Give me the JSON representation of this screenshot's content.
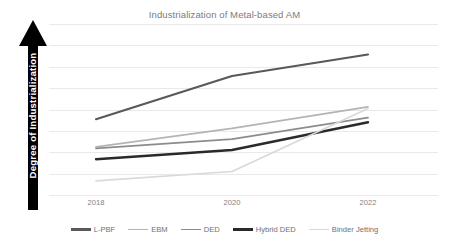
{
  "chart_data": {
    "type": "line",
    "title": "Industrialization of Metal-based AM",
    "xlabel": "",
    "ylabel": "Degree of Industrialization",
    "x": [
      2018,
      2020,
      2022
    ],
    "categories": [
      "2018",
      "2020",
      "2022"
    ],
    "grid": "horizontal",
    "legend_position": "bottom",
    "ylim": [
      0,
      100
    ],
    "y_axis_style": "arrow",
    "y_axis_ticks_visible": false,
    "series": [
      {
        "name": "L-PBF",
        "values": [
          46,
          74,
          88
        ],
        "color": "#595959"
      },
      {
        "name": "EBM",
        "values": [
          28,
          40,
          54
        ],
        "color": "#b4b4b4"
      },
      {
        "name": "DED",
        "values": [
          27,
          33,
          47
        ],
        "color": "#8c8c8c"
      },
      {
        "name": "Hybrid DED",
        "values": [
          20,
          26,
          44
        ],
        "color": "#2a2a2a"
      },
      {
        "name": "Binder Jetting",
        "values": [
          6,
          12,
          53
        ],
        "color": "#d9d9d9"
      }
    ]
  },
  "chart": {
    "title": "Industrialization of Metal-based AM",
    "y_axis_label": "Degree of Industrialization",
    "x_tick_labels": [
      "2018",
      "2020",
      "2022"
    ],
    "legend": [
      {
        "label": "L-PBF"
      },
      {
        "label": "EBM"
      },
      {
        "label": "DED"
      },
      {
        "label": "Hybrid DED"
      },
      {
        "label": "Binder Jetting"
      }
    ],
    "colors": {
      "title": "#7b7b7b",
      "gridline": "#e9e9e9",
      "tick_text": "#808080",
      "legend_text": "#707070",
      "axis_arrow": "#000000",
      "axis_label_text": "#ffffff",
      "background": "#ffffff"
    }
  }
}
